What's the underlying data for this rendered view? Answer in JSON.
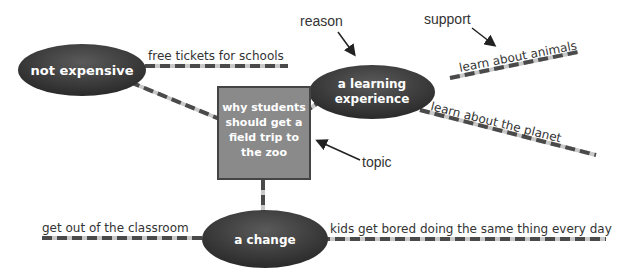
{
  "topic": {
    "lines": [
      "why students",
      "should get a",
      "field trip to",
      "the zoo"
    ]
  },
  "reasons": [
    {
      "id": "not-expensive",
      "lines": [
        "not expensive"
      ],
      "supports": [
        "free tickets for schools"
      ]
    },
    {
      "id": "learning",
      "lines": [
        "a learning",
        "experience"
      ],
      "supports": [
        "learn about animals",
        "learn about the planet"
      ]
    },
    {
      "id": "change",
      "lines": [
        "a change"
      ],
      "supports": [
        "get out of the classroom",
        "kids get bored doing the same thing every day"
      ]
    }
  ],
  "labels": {
    "reason": "reason",
    "support": "support",
    "topic": "topic"
  },
  "colors": {
    "ellipse": "#3a3a3a",
    "box": "#8a8a8a",
    "dash_dark": "#4a4a4a",
    "dash_light": "#c8c8c8"
  }
}
